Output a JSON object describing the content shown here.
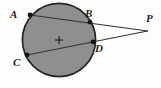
{
  "figure": {
    "kind": "circle-secants-diagram",
    "background_color": "#fdfdfd",
    "circle": {
      "fill_color": "#8f8f8f",
      "stroke_color": "#262626",
      "stroke_width": 1.6,
      "center_x": 59,
      "center_y": 40,
      "radius": 37
    },
    "center_mark": {
      "name": "center-cross",
      "x": 59,
      "y": 40,
      "arm": 4,
      "color": "#1d1d1d"
    },
    "external_point": {
      "label": "P",
      "x": 147,
      "y": 31
    },
    "points": [
      {
        "label": "A",
        "x": 30,
        "y": 15
      },
      {
        "label": "B",
        "x": 90,
        "y": 22
      },
      {
        "label": "C",
        "x": 27,
        "y": 55
      },
      {
        "label": "D",
        "x": 93,
        "y": 42
      }
    ],
    "segments": [
      {
        "name": "secant-A-to-P",
        "from": "A",
        "to": "P",
        "x1": 30,
        "y1": 15,
        "x2": 147,
        "y2": 31
      },
      {
        "name": "secant-C-to-P",
        "from": "C",
        "to": "P",
        "x1": 27,
        "y1": 55,
        "x2": 147,
        "y2": 31
      }
    ],
    "line_color": "#33332f",
    "line_width": 1.1,
    "dot_color": "#141414",
    "dot_radius": 2.3,
    "labels": {
      "A": "A",
      "B": "B",
      "C": "C",
      "D": "D",
      "P": "P"
    }
  }
}
